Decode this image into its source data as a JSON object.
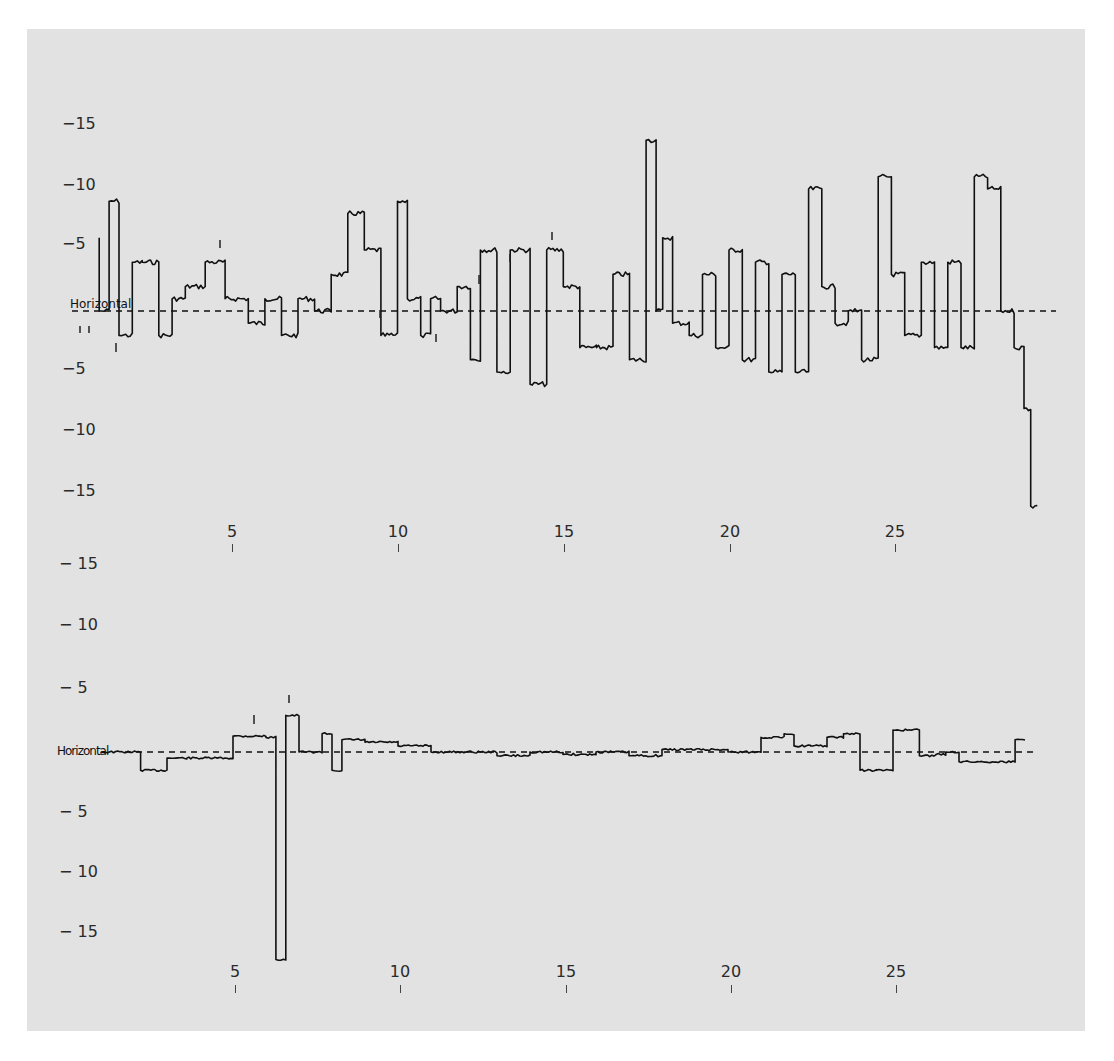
{
  "chart_data": [
    {
      "type": "line",
      "title": "",
      "panel": "top",
      "reference_line_label": "Horizontal",
      "reference_line_style": "dashed",
      "xlabel": "",
      "ylabel": "",
      "x_ticks": [
        "5",
        "10",
        "15",
        "20",
        "25"
      ],
      "y_ticks_above": [
        "−15",
        "−10",
        "−5"
      ],
      "y_ticks_below": [
        "−5",
        "−10",
        "−15"
      ],
      "xlim": [
        1,
        29.5
      ],
      "ylim": [
        -15,
        15
      ],
      "grid": false,
      "series": [
        {
          "name": "trace",
          "x": [
            1.0,
            1.3,
            1.6,
            2.0,
            2.3,
            2.8,
            3.2,
            3.4,
            3.6,
            4.2,
            4.8,
            5.5,
            6.0,
            6.5,
            7.0,
            7.5,
            8.0,
            8.5,
            9.0,
            9.5,
            10.0,
            10.3,
            10.7,
            11.0,
            11.3,
            11.8,
            12.2,
            12.5,
            13.0,
            13.4,
            14.0,
            14.5,
            15.0,
            15.5,
            16.0,
            16.5,
            17.0,
            17.5,
            17.8,
            18.0,
            18.3,
            18.8,
            19.2,
            19.6,
            20.0,
            20.4,
            20.8,
            21.2,
            21.6,
            22.0,
            22.4,
            22.8,
            23.2,
            23.6,
            24.0,
            24.5,
            24.9,
            25.3,
            25.8,
            26.2,
            26.6,
            27.0,
            27.4,
            27.8,
            28.2,
            28.6,
            28.9,
            29.1,
            29.3
          ],
          "y": [
            6,
            0,
            9,
            -2,
            4,
            4,
            -2,
            1,
            1,
            2,
            4,
            1,
            -1,
            1,
            -2,
            1,
            0,
            3,
            8,
            5,
            -2,
            9,
            1,
            -2,
            1,
            0,
            2,
            -4,
            5,
            -5,
            5,
            -6,
            5,
            2,
            -3,
            -3,
            3,
            -4,
            14,
            0,
            6,
            -1,
            -2,
            3,
            -3,
            5,
            -4,
            4,
            -5,
            3,
            -5,
            10,
            2,
            -1,
            0,
            -4,
            11,
            3,
            -2,
            4,
            -3,
            4,
            -3,
            11,
            10,
            0,
            -3,
            -8,
            -16
          ]
        }
      ]
    },
    {
      "type": "line",
      "title": "",
      "panel": "bottom",
      "reference_line_label": "Horizontal",
      "reference_line_style": "dashed",
      "xlabel": "",
      "ylabel": "",
      "x_ticks": [
        "5",
        "10",
        "15",
        "20",
        "25"
      ],
      "y_ticks_above": [
        "−15",
        "−10",
        "−5"
      ],
      "y_ticks_below": [
        "−5",
        "−10",
        "−15"
      ],
      "xlim": [
        1,
        29.5
      ],
      "ylim": [
        -15,
        15
      ],
      "grid": false,
      "series": [
        {
          "name": "trace",
          "x": [
            1.0,
            2.2,
            3.0,
            3.6,
            5.0,
            6.0,
            6.3,
            6.6,
            7.0,
            7.5,
            7.7,
            8.0,
            8.3,
            8.6,
            9.0,
            10.0,
            11.0,
            12.0,
            13.0,
            14.0,
            15.0,
            16.0,
            17.0,
            18.0,
            19.0,
            20.0,
            21.0,
            21.7,
            22.0,
            22.5,
            23.0,
            23.5,
            24.0,
            24.5,
            25.0,
            25.5,
            25.8,
            26.3,
            26.6,
            27.0,
            28.0,
            28.7,
            29.0
          ],
          "y": [
            0,
            0,
            -1.5,
            -0.5,
            -0.5,
            1.3,
            1.2,
            -17,
            3,
            0,
            0,
            1.5,
            -1.5,
            1,
            1,
            0.8,
            0.5,
            0,
            0,
            -0.3,
            0,
            -0.2,
            0,
            -0.3,
            0.2,
            0.2,
            0,
            1.2,
            1.5,
            0.5,
            0.5,
            1.2,
            1.5,
            -1.5,
            -1.5,
            1.8,
            1.8,
            -0.3,
            -0.2,
            0,
            -0.8,
            -0.8,
            1
          ]
        }
      ]
    }
  ],
  "top_chart": {
    "y_labels": [
      {
        "text": "−15",
        "y": 116
      },
      {
        "text": "−10",
        "y": 177
      },
      {
        "text": "−5",
        "y": 236
      },
      {
        "text": "−5",
        "y": 361
      },
      {
        "text": "−10",
        "y": 422
      },
      {
        "text": "−15",
        "y": 483
      },
      {
        "text": "− 15",
        "y": 556
      }
    ],
    "reference_label": "Horizontal",
    "x_labels": [
      "5",
      "10",
      "15",
      "20",
      "25"
    ]
  },
  "bottom_chart": {
    "y_labels": [
      {
        "text": "− 10",
        "y": 617
      },
      {
        "text": "− 5",
        "y": 680
      },
      {
        "text": "− 5",
        "y": 804
      },
      {
        "text": "− 10",
        "y": 864
      },
      {
        "text": "− 15",
        "y": 924
      }
    ],
    "reference_label": "Horizontal",
    "x_labels": [
      "5",
      "10",
      "15",
      "20",
      "25"
    ]
  },
  "colors": {
    "panel_background": "#e2e2e2",
    "trace": "#111111",
    "text": "#2a2a2a"
  }
}
